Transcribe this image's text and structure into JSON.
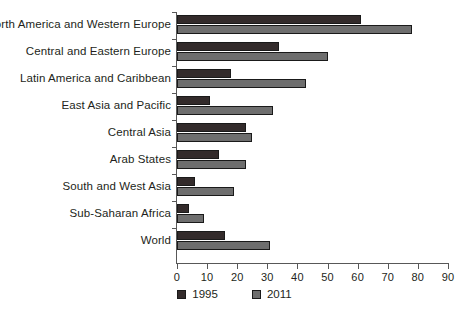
{
  "chart_data": {
    "type": "bar",
    "orientation": "horizontal",
    "title": "",
    "subtitle": "",
    "xlabel": "",
    "ylabel": "",
    "xlim": [
      0,
      90
    ],
    "xticks": [
      0,
      10,
      20,
      30,
      40,
      50,
      60,
      70,
      80,
      90
    ],
    "xtick_labels": [
      "0",
      "10",
      "20",
      "30",
      "40",
      "50",
      "60",
      "70",
      "80",
      "90"
    ],
    "grid": false,
    "legend_position": "bottom-center",
    "categories": [
      "North America and Western Europe",
      "Central and Eastern Europe",
      "Latin America and Caribbean",
      "East Asia and Pacific",
      "Central Asia",
      "Arab States",
      "South and West Asia",
      "Sub-Saharan Africa",
      "World"
    ],
    "series": [
      {
        "name": "1995",
        "color": "#332b2b",
        "values": [
          61,
          34,
          18,
          11,
          23,
          14,
          6,
          4,
          16
        ]
      },
      {
        "name": "2011",
        "color": "#6e6e6e",
        "values": [
          78,
          50,
          43,
          32,
          25,
          23,
          19,
          9,
          31
        ]
      }
    ]
  },
  "legend": {
    "items": [
      {
        "label": "1995",
        "color": "#332b2b"
      },
      {
        "label": "2011",
        "color": "#6e6e6e"
      }
    ]
  },
  "colors": {
    "series_1995": "#332b2b",
    "series_2011": "#6e6e6e",
    "axis": "#585858",
    "text": "#231f20",
    "background": "#ffffff"
  }
}
